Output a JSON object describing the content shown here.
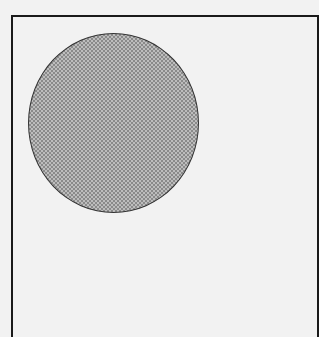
{
  "diagram": {
    "frame": {
      "stroke_color": "#1a1a1a",
      "background": "#f2f2f2"
    },
    "shapes": [
      {
        "type": "circle",
        "fill": "dotted-gray",
        "fill_color": "#a8a8a8",
        "stroke_color": "#333333"
      }
    ]
  }
}
